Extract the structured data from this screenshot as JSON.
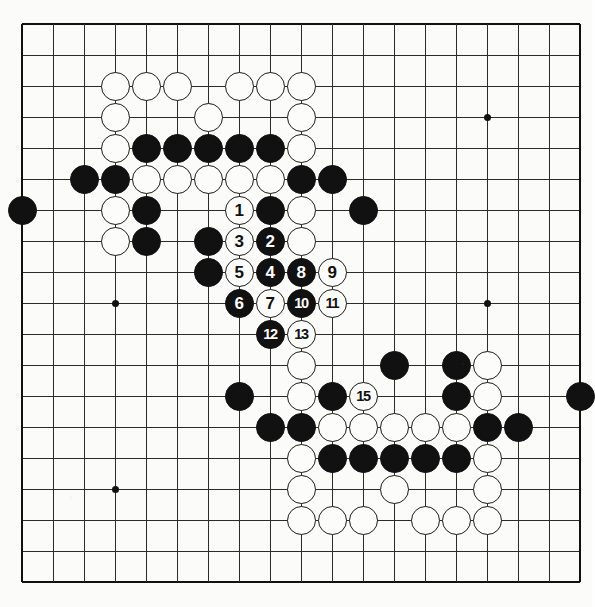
{
  "diagram": {
    "type": "go-board-diagram",
    "board_size": 19,
    "title": "",
    "colors": {
      "black_stone": "#111111",
      "white_stone": "#fcfcfa",
      "stone_outline": "#1a1a1a",
      "grid_line": "#2b2b2b",
      "board_background": "#fbfbf9"
    },
    "geometry": {
      "origin_x": 22,
      "origin_y": 24,
      "spacing": 31,
      "stone_diameter": 29
    },
    "star_points": [
      {
        "col": 3,
        "row": 3
      },
      {
        "col": 9,
        "row": 3
      },
      {
        "col": 15,
        "row": 3
      },
      {
        "col": 3,
        "row": 9
      },
      {
        "col": 9,
        "row": 9
      },
      {
        "col": 15,
        "row": 9
      },
      {
        "col": 3,
        "row": 15
      },
      {
        "col": 9,
        "row": 15
      },
      {
        "col": 15,
        "row": 15
      }
    ],
    "move_count": 15,
    "moves": [
      {
        "n": 1,
        "col": 7,
        "row": 6,
        "color": "white"
      },
      {
        "n": 2,
        "col": 8,
        "row": 7,
        "color": "black"
      },
      {
        "n": 3,
        "col": 7,
        "row": 7,
        "color": "white"
      },
      {
        "n": 4,
        "col": 8,
        "row": 8,
        "color": "black"
      },
      {
        "n": 5,
        "col": 7,
        "row": 8,
        "color": "white"
      },
      {
        "n": 6,
        "col": 7,
        "row": 9,
        "color": "black"
      },
      {
        "n": 7,
        "col": 8,
        "row": 9,
        "color": "white"
      },
      {
        "n": 8,
        "col": 9,
        "row": 8,
        "color": "black"
      },
      {
        "n": 9,
        "col": 10,
        "row": 8,
        "color": "white"
      },
      {
        "n": 10,
        "col": 9,
        "row": 9,
        "color": "black"
      },
      {
        "n": 11,
        "col": 10,
        "row": 9,
        "color": "white"
      },
      {
        "n": 12,
        "col": 8,
        "row": 10,
        "color": "black"
      },
      {
        "n": 13,
        "col": 9,
        "row": 10,
        "color": "white"
      },
      {
        "n": 15,
        "col": 11,
        "row": 12,
        "color": "white"
      }
    ],
    "plain_stones": [
      {
        "col": 3,
        "row": 2,
        "color": "white"
      },
      {
        "col": 4,
        "row": 2,
        "color": "white"
      },
      {
        "col": 5,
        "row": 2,
        "color": "white"
      },
      {
        "col": 7,
        "row": 2,
        "color": "white"
      },
      {
        "col": 8,
        "row": 2,
        "color": "white"
      },
      {
        "col": 9,
        "row": 2,
        "color": "white"
      },
      {
        "col": 3,
        "row": 3,
        "color": "white"
      },
      {
        "col": 6,
        "row": 3,
        "color": "white"
      },
      {
        "col": 9,
        "row": 3,
        "color": "white"
      },
      {
        "col": 3,
        "row": 4,
        "color": "white"
      },
      {
        "col": 4,
        "row": 4,
        "color": "black"
      },
      {
        "col": 5,
        "row": 4,
        "color": "black"
      },
      {
        "col": 6,
        "row": 4,
        "color": "black"
      },
      {
        "col": 7,
        "row": 4,
        "color": "black"
      },
      {
        "col": 8,
        "row": 4,
        "color": "black"
      },
      {
        "col": 9,
        "row": 4,
        "color": "white"
      },
      {
        "col": 2,
        "row": 5,
        "color": "black"
      },
      {
        "col": 3,
        "row": 5,
        "color": "black"
      },
      {
        "col": 4,
        "row": 5,
        "color": "white"
      },
      {
        "col": 5,
        "row": 5,
        "color": "white"
      },
      {
        "col": 6,
        "row": 5,
        "color": "white"
      },
      {
        "col": 7,
        "row": 5,
        "color": "white"
      },
      {
        "col": 8,
        "row": 5,
        "color": "white"
      },
      {
        "col": 9,
        "row": 5,
        "color": "black"
      },
      {
        "col": 10,
        "row": 5,
        "color": "black"
      },
      {
        "col": 0,
        "row": 6,
        "color": "black"
      },
      {
        "col": 3,
        "row": 6,
        "color": "white"
      },
      {
        "col": 4,
        "row": 6,
        "color": "black"
      },
      {
        "col": 8,
        "row": 6,
        "color": "black"
      },
      {
        "col": 9,
        "row": 6,
        "color": "white"
      },
      {
        "col": 11,
        "row": 6,
        "color": "black"
      },
      {
        "col": 3,
        "row": 7,
        "color": "white"
      },
      {
        "col": 4,
        "row": 7,
        "color": "black"
      },
      {
        "col": 6,
        "row": 7,
        "color": "black"
      },
      {
        "col": 9,
        "row": 7,
        "color": "white"
      },
      {
        "col": 6,
        "row": 8,
        "color": "black"
      },
      {
        "col": 12,
        "row": 11,
        "color": "black"
      },
      {
        "col": 14,
        "row": 11,
        "color": "black"
      },
      {
        "col": 15,
        "row": 11,
        "color": "white"
      },
      {
        "col": 9,
        "row": 11,
        "color": "white"
      },
      {
        "col": 7,
        "row": 12,
        "color": "black"
      },
      {
        "col": 9,
        "row": 12,
        "color": "white"
      },
      {
        "col": 10,
        "row": 12,
        "color": "black"
      },
      {
        "col": 14,
        "row": 12,
        "color": "black"
      },
      {
        "col": 15,
        "row": 12,
        "color": "white"
      },
      {
        "col": 18,
        "row": 12,
        "color": "black"
      },
      {
        "col": 8,
        "row": 13,
        "color": "black"
      },
      {
        "col": 9,
        "row": 13,
        "color": "black"
      },
      {
        "col": 10,
        "row": 13,
        "color": "white"
      },
      {
        "col": 11,
        "row": 13,
        "color": "white"
      },
      {
        "col": 12,
        "row": 13,
        "color": "white"
      },
      {
        "col": 13,
        "row": 13,
        "color": "white"
      },
      {
        "col": 14,
        "row": 13,
        "color": "white"
      },
      {
        "col": 15,
        "row": 13,
        "color": "black"
      },
      {
        "col": 16,
        "row": 13,
        "color": "black"
      },
      {
        "col": 9,
        "row": 14,
        "color": "white"
      },
      {
        "col": 10,
        "row": 14,
        "color": "black"
      },
      {
        "col": 11,
        "row": 14,
        "color": "black"
      },
      {
        "col": 12,
        "row": 14,
        "color": "black"
      },
      {
        "col": 13,
        "row": 14,
        "color": "black"
      },
      {
        "col": 14,
        "row": 14,
        "color": "black"
      },
      {
        "col": 15,
        "row": 14,
        "color": "white"
      },
      {
        "col": 9,
        "row": 15,
        "color": "white"
      },
      {
        "col": 12,
        "row": 15,
        "color": "white"
      },
      {
        "col": 15,
        "row": 15,
        "color": "white"
      },
      {
        "col": 9,
        "row": 16,
        "color": "white"
      },
      {
        "col": 10,
        "row": 16,
        "color": "white"
      },
      {
        "col": 11,
        "row": 16,
        "color": "white"
      },
      {
        "col": 13,
        "row": 16,
        "color": "white"
      },
      {
        "col": 14,
        "row": 16,
        "color": "white"
      },
      {
        "col": 15,
        "row": 16,
        "color": "white"
      }
    ]
  }
}
